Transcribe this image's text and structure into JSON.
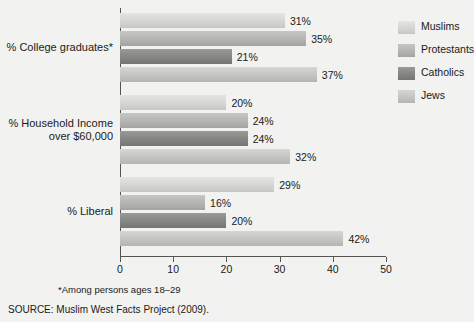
{
  "chart_data": {
    "type": "bar",
    "orientation": "horizontal",
    "title": "",
    "xlabel": "",
    "ylabel": "",
    "xlim": [
      0,
      50
    ],
    "xticks": [
      0,
      10,
      20,
      30,
      40,
      50
    ],
    "xtick_labels": [
      "0",
      "10",
      "20",
      "30",
      "40",
      "50"
    ],
    "grid": false,
    "legend_position": "right",
    "value_suffix": "%",
    "categories": [
      "% College graduates*",
      "% Household Income over $60,000",
      "% Liberal"
    ],
    "category_lines": [
      [
        "% College graduates*"
      ],
      [
        "% Household Income",
        "over $60,000"
      ],
      [
        "% Liberal"
      ]
    ],
    "series": [
      {
        "name": "Muslims",
        "color": "#dcdcda",
        "values": [
          31,
          20,
          29
        ]
      },
      {
        "name": "Protestants",
        "color": "#bcbcba",
        "values": [
          35,
          24,
          16
        ]
      },
      {
        "name": "Catholics",
        "color": "#8e8e8c",
        "values": [
          21,
          24,
          20
        ]
      },
      {
        "name": "Jews",
        "color": "#ccccca",
        "values": [
          37,
          32,
          42
        ]
      }
    ],
    "value_labels": [
      [
        "31%",
        "35%",
        "21%",
        "37%"
      ],
      [
        "20%",
        "24%",
        "24%",
        "32%"
      ],
      [
        "29%",
        "16%",
        "20%",
        "42%"
      ]
    ],
    "footnote": "*Among persons ages 18–29",
    "source": "SOURCE: Muslim West Facts Project (2009)."
  }
}
